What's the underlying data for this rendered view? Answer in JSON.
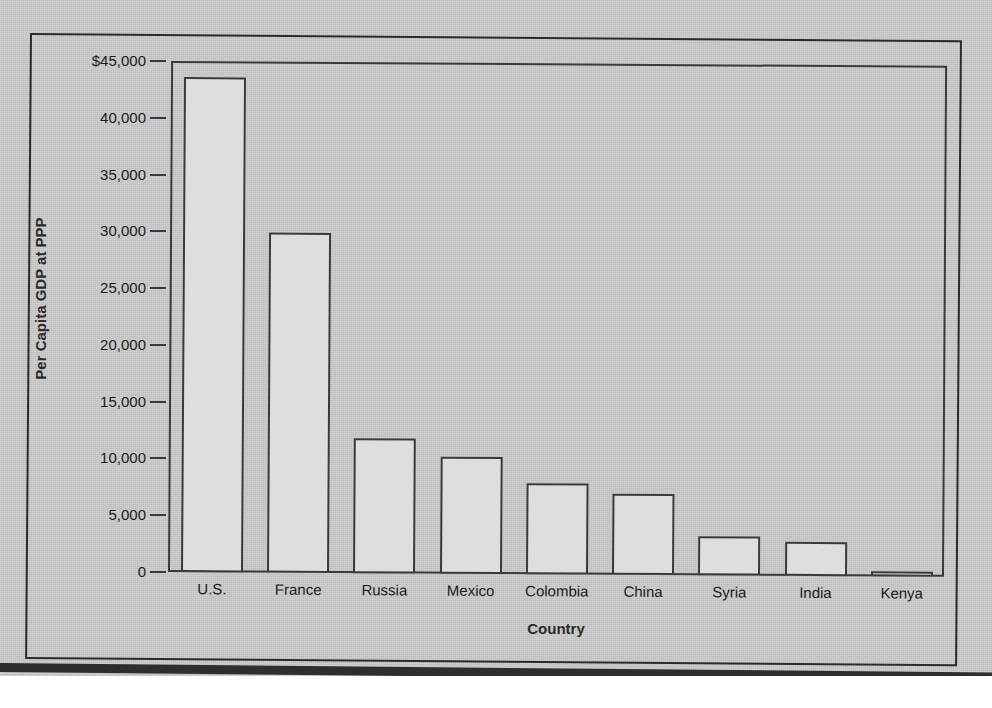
{
  "chart_data": {
    "type": "bar",
    "title": "",
    "xlabel": "Country",
    "ylabel": "Per Capita GDP at PPP",
    "categories": [
      "U.S.",
      "France",
      "Russia",
      "Mexico",
      "Colombia",
      "China",
      "Syria",
      "India",
      "Kenya"
    ],
    "values": [
      43600,
      29950,
      11900,
      10300,
      8000,
      7100,
      3450,
      3000,
      450
    ],
    "ylim": [
      0,
      45000
    ],
    "ytick_values": [
      0,
      5000,
      10000,
      15000,
      20000,
      25000,
      30000,
      35000,
      40000,
      45000
    ],
    "ytick_labels": [
      "0",
      "5,000",
      "10,000",
      "15,000",
      "20,000",
      "25,000",
      "30,000",
      "35,000",
      "40,000",
      "$45,000"
    ],
    "grid": false,
    "legend": null,
    "bar_fill_color": "#dedede",
    "bar_edge_color": "#3a3a3a",
    "plot_background_color": "#cbcbcb",
    "axis_color": "#3a3a3a"
  },
  "figure": {
    "frame_color": "#2b2b2b",
    "page_background": "#cbcbcb"
  }
}
